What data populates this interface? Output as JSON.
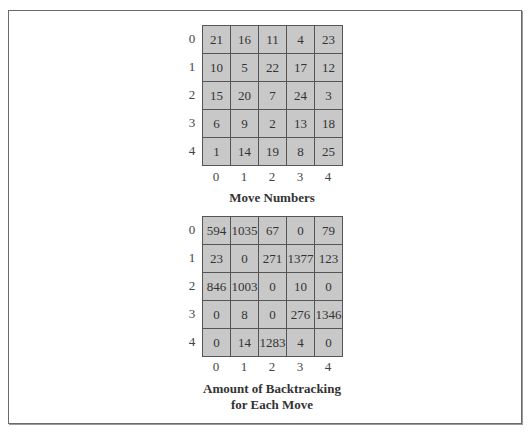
{
  "figure": {
    "grids": [
      {
        "caption": "Move Numbers",
        "caption_lines": [
          "Move Numbers"
        ],
        "row_labels": [
          "0",
          "1",
          "2",
          "3",
          "4"
        ],
        "col_labels": [
          "0",
          "1",
          "2",
          "3",
          "4"
        ],
        "cells": [
          [
            "21",
            "16",
            "11",
            "4",
            "23"
          ],
          [
            "10",
            "5",
            "22",
            "17",
            "12"
          ],
          [
            "15",
            "20",
            "7",
            "24",
            "3"
          ],
          [
            "6",
            "9",
            "2",
            "13",
            "18"
          ],
          [
            "1",
            "14",
            "19",
            "8",
            "25"
          ]
        ]
      },
      {
        "caption": "Amount of Backtracking for Each Move",
        "caption_lines": [
          "Amount of Backtracking",
          "for Each Move"
        ],
        "row_labels": [
          "0",
          "1",
          "2",
          "3",
          "4"
        ],
        "col_labels": [
          "0",
          "1",
          "2",
          "3",
          "4"
        ],
        "cells": [
          [
            "594",
            "1035",
            "67",
            "0",
            "79"
          ],
          [
            "23",
            "0",
            "271",
            "1377",
            "123"
          ],
          [
            "846",
            "1003",
            "0",
            "10",
            "0"
          ],
          [
            "0",
            "8",
            "0",
            "276",
            "1346"
          ],
          [
            "0",
            "14",
            "1283",
            "4",
            "0"
          ]
        ]
      }
    ],
    "colors": {
      "cell_fill": "#c8c8c8",
      "grid_line": "#555555",
      "frame": "#6a6a6a",
      "background": "#ffffff"
    }
  }
}
